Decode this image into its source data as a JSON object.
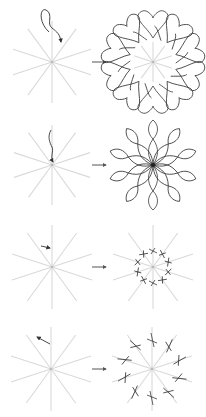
{
  "figure": {
    "symmetry_order": 10,
    "colors": {
      "guide": "#d9d9d9",
      "stroke": "#333333",
      "arrow": "#555555",
      "background": "#ffffff"
    },
    "rows": [
      {
        "id": "row-1",
        "input_label": "looping stroke with arrowhead",
        "output_label": "heart rosette",
        "center_left": [
          52,
          62
        ],
        "center_right": [
          153,
          62
        ]
      },
      {
        "id": "row-2",
        "input_label": "wavy stroke toward center",
        "output_label": "petal flower",
        "center_left": [
          52,
          165
        ],
        "center_right": [
          153,
          165
        ]
      },
      {
        "id": "row-3",
        "input_label": "short arrow stroke",
        "output_label": "small cross ring",
        "center_left": [
          52,
          267
        ],
        "center_right": [
          153,
          267
        ]
      },
      {
        "id": "row-4",
        "input_label": "short arrow stroke outward",
        "output_label": "large cross ring",
        "center_left": [
          51,
          369
        ],
        "center_right": [
          152,
          369
        ]
      }
    ]
  }
}
